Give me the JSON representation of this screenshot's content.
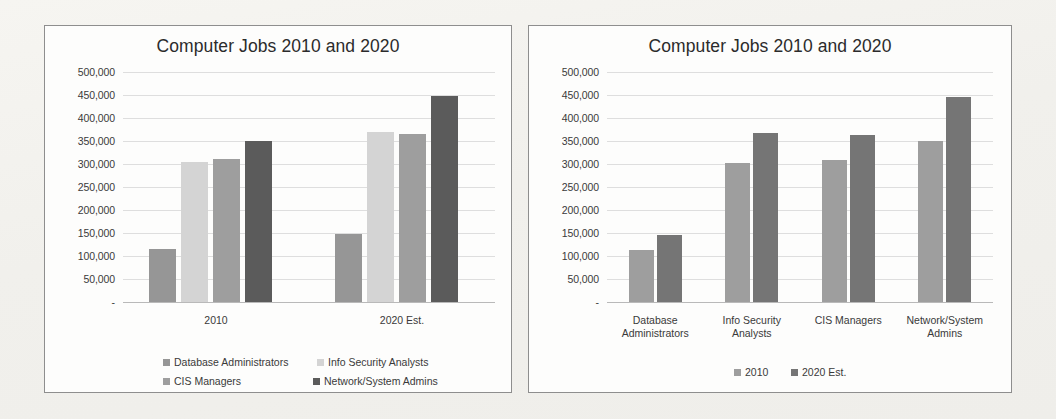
{
  "page": {
    "background": "#f4f3ef"
  },
  "panels": [
    {
      "id": "left",
      "title": "Computer Jobs 2010 and 2020",
      "legend_layout": "two-column"
    },
    {
      "id": "right",
      "title": "Computer Jobs 2010 and 2020",
      "legend_layout": "single-row"
    }
  ],
  "axis": {
    "ticks": [
      "500,000",
      "450,000",
      "400,000",
      "350,000",
      "300,000",
      "250,000",
      "200,000",
      "150,000",
      "100,000",
      "50,000",
      "-"
    ],
    "max": 500000,
    "min": 0,
    "step": 50000,
    "zero_label": "-"
  },
  "colors": {
    "database_administrators": "#969696",
    "info_security_analysts": "#d4d4d4",
    "cis_managers": "#9e9e9e",
    "network_system_admins": "#5b5b5b",
    "year_2010": "#9e9e9e",
    "year_2020": "#757575",
    "gridline": "#d8d8d8",
    "axisline": "#b9b9b9",
    "panel_border": "#8e8e8e",
    "text": "#3a3a3a"
  },
  "chart_data": [
    {
      "type": "bar",
      "title": "Computer Jobs 2010 and 2020",
      "xlabel": "",
      "ylabel": "",
      "ylim": [
        0,
        500000
      ],
      "ytick_labels": [
        "-",
        "50,000",
        "100,000",
        "150,000",
        "200,000",
        "250,000",
        "300,000",
        "350,000",
        "400,000",
        "450,000",
        "500,000"
      ],
      "grid": true,
      "legend_position": "bottom",
      "categories": [
        "2010",
        "2020 Est."
      ],
      "series": [
        {
          "name": "Database Administrators",
          "values": [
            115000,
            148000
          ],
          "color": "#969696"
        },
        {
          "name": "Info Security Analysts",
          "values": [
            305000,
            370000
          ],
          "color": "#d4d4d4"
        },
        {
          "name": "CIS Managers",
          "values": [
            310000,
            365000
          ],
          "color": "#9e9e9e"
        },
        {
          "name": "Network/System Admins",
          "values": [
            350000,
            448000
          ],
          "color": "#5b5b5b"
        }
      ]
    },
    {
      "type": "bar",
      "title": "Computer Jobs 2010 and 2020",
      "xlabel": "",
      "ylabel": "",
      "ylim": [
        0,
        500000
      ],
      "ytick_labels": [
        "-",
        "50,000",
        "100,000",
        "150,000",
        "200,000",
        "250,000",
        "300,000",
        "350,000",
        "400,000",
        "450,000",
        "500,000"
      ],
      "grid": true,
      "legend_position": "bottom",
      "categories": [
        "Database\nAdministrators",
        "Info Security\nAnalysts",
        "CIS Managers",
        "Network/System\nAdmins"
      ],
      "series": [
        {
          "name": "2010",
          "values": [
            112000,
            303000,
            309000,
            349000
          ],
          "color": "#9e9e9e"
        },
        {
          "name": "2020 Est.",
          "values": [
            145000,
            368000,
            363000,
            445000
          ],
          "color": "#757575"
        }
      ]
    }
  ]
}
